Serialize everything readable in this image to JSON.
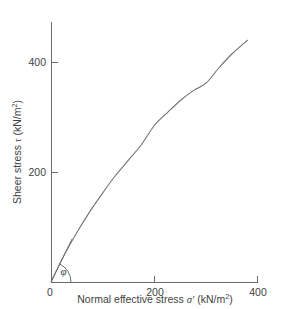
{
  "chart_data": {
    "type": "line",
    "title": "",
    "xlabel": "Normal effective stress σ′ (kN/m²)",
    "ylabel": "Sheer stress τ (kN/m²)",
    "xlabel_parts": {
      "text": "Normal effective stress",
      "symbol": "σ′",
      "units_pre": "(kN/m",
      "units_sup": "2",
      "units_post": ")"
    },
    "ylabel_parts": {
      "text": "Sheer stress",
      "symbol": "τ",
      "units_pre": "(kN/m",
      "units_sup": "2",
      "units_post": ")"
    },
    "xlim": [
      0,
      420
    ],
    "ylim": [
      0,
      460
    ],
    "xticks": [
      0,
      200,
      400
    ],
    "xtick_labels": [
      "0",
      "200",
      "400"
    ],
    "yticks": [
      200,
      400
    ],
    "ytick_labels": [
      "200",
      "400"
    ],
    "grid": false,
    "legend": false,
    "series": [
      {
        "name": "failure envelope",
        "x": [
          0,
          25,
          50,
          75,
          100,
          125,
          150,
          175,
          200,
          225,
          250,
          275,
          300,
          325,
          350,
          380
        ],
        "y": [
          0,
          48,
          90,
          128,
          162,
          194,
          222,
          250,
          285,
          308,
          330,
          348,
          362,
          390,
          415,
          440
        ]
      }
    ],
    "annotations": [
      {
        "name": "friction-angle",
        "label": "φ",
        "type": "angle-arc",
        "vertex": [
          0,
          0
        ],
        "between": [
          "x-axis",
          "initial tangent of failure envelope"
        ]
      }
    ]
  },
  "axes_geometry": {
    "x0_px": 51,
    "y0_px": 282,
    "x_per_unit": 0.5175,
    "y_per_unit": 0.55,
    "y_axis_top_px": 22,
    "x_axis_right_px": 258
  },
  "colors": {
    "line": "#6e6e6e",
    "axis": "#6b6b6b",
    "text": "#3f3f3f",
    "background": "#ffffff"
  }
}
